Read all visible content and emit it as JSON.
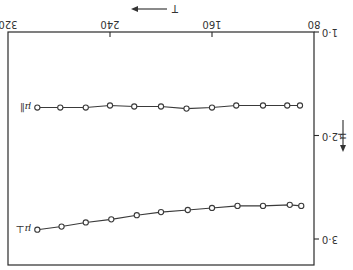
{
  "figure": {
    "orientation": "rotated 180 degrees",
    "x_axis_label": "T",
    "y_axis_label": "μ",
    "x_ticks": [
      "80",
      "160",
      "240",
      "320"
    ],
    "y_ticks": [
      "1·0",
      "2·0",
      "3·0"
    ],
    "series_labels": [
      "μ∥",
      "μ⊥"
    ]
  },
  "chart_data": {
    "type": "line",
    "title": "",
    "xlabel": "T",
    "ylabel": "μ",
    "xlim": [
      80,
      320
    ],
    "ylim": [
      1.0,
      3.2
    ],
    "y_inverted": true,
    "grid": false,
    "legend": "inline labels at high-T end of curves",
    "x_ticks": [
      80,
      160,
      240,
      320
    ],
    "y_ticks": [
      1.0,
      2.0,
      3.0
    ],
    "series": [
      {
        "name": "μ∥",
        "marker": "open circle",
        "x": [
          91,
          101,
          120,
          141,
          160,
          180,
          200,
          221,
          240,
          259,
          279,
          297
        ],
        "values": [
          1.71,
          1.71,
          1.71,
          1.71,
          1.73,
          1.74,
          1.72,
          1.72,
          1.71,
          1.73,
          1.73,
          1.73
        ]
      },
      {
        "name": "μ⊥",
        "marker": "open circle",
        "x": [
          90,
          99,
          120,
          140,
          160,
          179,
          200,
          219,
          239,
          259,
          278,
          297
        ],
        "values": [
          2.68,
          2.67,
          2.68,
          2.68,
          2.7,
          2.72,
          2.74,
          2.77,
          2.81,
          2.84,
          2.88,
          2.91
        ]
      }
    ]
  }
}
